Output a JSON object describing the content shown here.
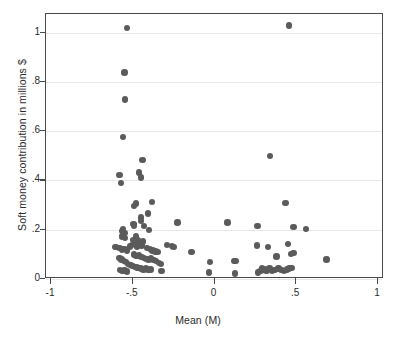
{
  "chart_data": {
    "type": "scatter",
    "title": "",
    "xlabel": "Mean (M)",
    "ylabel": "Soft money contribution in millions $",
    "xlim": [
      -1,
      1
    ],
    "ylim": [
      0,
      1.08
    ],
    "xticks": [
      -1,
      -0.5,
      0,
      0.5,
      1
    ],
    "xticklabels": [
      "-1",
      "-.5",
      "0",
      ".5",
      "1"
    ],
    "yticks": [
      0,
      0.2,
      0.4,
      0.6,
      0.8,
      1
    ],
    "yticklabels": [
      "0",
      ".2",
      ".4",
      ".6",
      ".8",
      "1"
    ],
    "grid": "horizontal",
    "legend": "none",
    "marker": {
      "shape": "circle",
      "color": "#5b5b5b",
      "size_px": 6.4
    },
    "n_points": 104,
    "points": [
      [
        -0.53,
        1.015
      ],
      [
        0.46,
        1.025
      ],
      [
        -0.545,
        0.835
      ],
      [
        -0.54,
        0.725
      ],
      [
        -0.555,
        0.572
      ],
      [
        0.345,
        0.495
      ],
      [
        -0.435,
        0.478
      ],
      [
        -0.455,
        0.428
      ],
      [
        -0.575,
        0.418
      ],
      [
        -0.445,
        0.408
      ],
      [
        -0.565,
        0.385
      ],
      [
        -0.375,
        0.308
      ],
      [
        0.44,
        0.305
      ],
      [
        -0.475,
        0.302
      ],
      [
        -0.485,
        0.293
      ],
      [
        -0.4,
        0.262
      ],
      [
        -0.445,
        0.245
      ],
      [
        -0.445,
        0.232
      ],
      [
        -0.49,
        0.22
      ],
      [
        -0.485,
        0.213
      ],
      [
        0.085,
        0.225
      ],
      [
        0.27,
        0.21
      ],
      [
        0.49,
        0.208
      ],
      [
        0.565,
        0.198
      ],
      [
        -0.425,
        0.21
      ],
      [
        -0.395,
        0.195
      ],
      [
        -0.555,
        0.198
      ],
      [
        -0.558,
        0.19
      ],
      [
        -0.545,
        0.182
      ],
      [
        -0.552,
        0.175
      ],
      [
        -0.56,
        0.168
      ],
      [
        -0.542,
        0.162
      ],
      [
        -0.22,
        0.225
      ],
      [
        -0.475,
        0.168
      ],
      [
        -0.49,
        0.155
      ],
      [
        -0.475,
        0.148
      ],
      [
        -0.46,
        0.152
      ],
      [
        -0.445,
        0.145
      ],
      [
        -0.432,
        0.148
      ],
      [
        -0.455,
        0.138
      ],
      [
        -0.44,
        0.132
      ],
      [
        -0.468,
        0.128
      ],
      [
        -0.5,
        0.135
      ],
      [
        -0.512,
        0.128
      ],
      [
        -0.6,
        0.125
      ],
      [
        -0.575,
        0.122
      ],
      [
        -0.558,
        0.115
      ],
      [
        -0.545,
        0.118
      ],
      [
        -0.528,
        0.112
      ],
      [
        -0.405,
        0.122
      ],
      [
        -0.388,
        0.118
      ],
      [
        -0.372,
        0.112
      ],
      [
        -0.355,
        0.108
      ],
      [
        -0.34,
        0.105
      ],
      [
        -0.285,
        0.135
      ],
      [
        -0.255,
        0.13
      ],
      [
        -0.245,
        0.125
      ],
      [
        -0.135,
        0.105
      ],
      [
        0.265,
        0.132
      ],
      [
        0.335,
        0.125
      ],
      [
        0.455,
        0.138
      ],
      [
        0.49,
        0.102
      ],
      [
        0.475,
        0.098
      ],
      [
        0.385,
        0.088
      ],
      [
        0.69,
        0.075
      ],
      [
        -0.02,
        0.065
      ],
      [
        0.135,
        0.07
      ],
      [
        0.125,
        0.068
      ],
      [
        -0.488,
        0.095
      ],
      [
        -0.472,
        0.09
      ],
      [
        -0.455,
        0.092
      ],
      [
        -0.44,
        0.085
      ],
      [
        -0.425,
        0.082
      ],
      [
        -0.412,
        0.078
      ],
      [
        -0.398,
        0.075
      ],
      [
        -0.382,
        0.082
      ],
      [
        -0.368,
        0.072
      ],
      [
        -0.352,
        0.068
      ],
      [
        -0.335,
        0.062
      ],
      [
        -0.322,
        0.058
      ],
      [
        -0.575,
        0.082
      ],
      [
        -0.562,
        0.075
      ],
      [
        -0.548,
        0.07
      ],
      [
        -0.535,
        0.065
      ],
      [
        -0.522,
        0.058
      ],
      [
        -0.508,
        0.052
      ],
      [
        -0.495,
        0.048
      ],
      [
        -0.482,
        0.045
      ],
      [
        -0.468,
        0.042
      ],
      [
        -0.455,
        0.04
      ],
      [
        -0.442,
        0.038
      ],
      [
        -0.428,
        0.035
      ],
      [
        -0.412,
        0.038
      ],
      [
        -0.398,
        0.033
      ],
      [
        -0.385,
        0.035
      ],
      [
        -0.572,
        0.032
      ],
      [
        -0.558,
        0.028
      ],
      [
        -0.545,
        0.03
      ],
      [
        -0.53,
        0.026
      ],
      [
        -0.318,
        0.028
      ],
      [
        -0.028,
        0.022
      ],
      [
        0.132,
        0.018
      ],
      [
        0.272,
        0.022
      ],
      [
        0.288,
        0.028
      ],
      [
        0.298,
        0.04
      ],
      [
        0.312,
        0.035
      ],
      [
        0.325,
        0.03
      ],
      [
        0.342,
        0.038
      ],
      [
        0.358,
        0.028
      ],
      [
        0.372,
        0.032
      ],
      [
        0.398,
        0.038
      ],
      [
        0.415,
        0.032
      ],
      [
        0.432,
        0.028
      ],
      [
        0.448,
        0.035
      ],
      [
        0.462,
        0.038
      ],
      [
        0.478,
        0.04
      ]
    ]
  },
  "axes": {
    "frame_color": "#4a4a4a",
    "grid_color": "#e8e8e8",
    "background": "#ffffff"
  }
}
